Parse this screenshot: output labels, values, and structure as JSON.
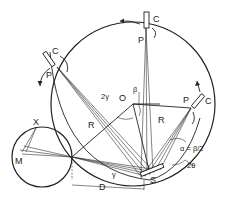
{
  "diagram": {
    "type": "focusing-circle diffraction geometry",
    "labels": {
      "C_top": "C",
      "P_top": "P",
      "C_left": "C",
      "P_left": "P",
      "C_right": "C",
      "P_right": "P",
      "X": "X",
      "M": "M",
      "O": "O",
      "beta": "β",
      "two_gamma": "2γ",
      "R_left": "R",
      "R_right": "R",
      "alpha": "α = β/2",
      "two_theta": "2θ",
      "gamma": "γ",
      "S": "S",
      "D": "D"
    },
    "elements": {
      "focusing_circle": "large circle centered at O with radius R",
      "source_circle": "small circle at left passing through X and M",
      "detectors": [
        "C (top)",
        "C (upper-left)",
        "C (right)"
      ],
      "sample": "S"
    }
  }
}
